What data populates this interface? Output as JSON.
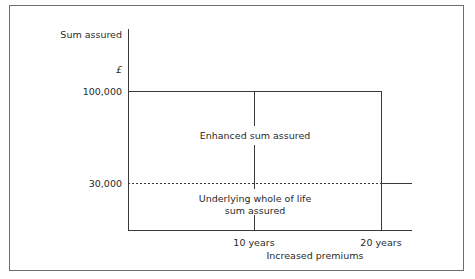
{
  "diagram": {
    "y_axis_title": "Sum assured",
    "y_unit": "£",
    "y_ticks": [
      "100,000",
      "30,000"
    ],
    "x_ticks": [
      "10 years",
      "20 years"
    ],
    "x_axis_title": "Increased premiums",
    "regions": {
      "upper": "Enhanced sum assured",
      "lower_line1": "Underlying whole of life",
      "lower_line2": "sum assured"
    },
    "colors": {
      "line": "#3a3a3a",
      "frame": "#6d6d6d",
      "text": "#2a2a2a"
    }
  }
}
